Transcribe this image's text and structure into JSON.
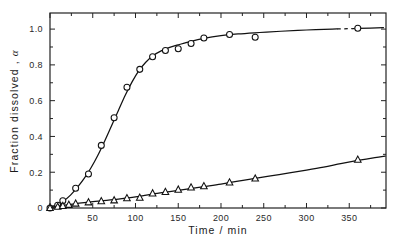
{
  "chart_data": {
    "type": "scatter",
    "title": "",
    "xlabel": "Time / min",
    "ylabel": "Fraction dissolved, α",
    "ylabel_text": "Fraction  dissolved ,",
    "ylabel_symbol": "α",
    "xlim": [
      0,
      393
    ],
    "ylim": [
      0,
      1.09
    ],
    "grid": false,
    "legend": "none",
    "x_ticks": [
      0,
      50,
      100,
      150,
      200,
      250,
      300,
      350
    ],
    "x_tick_labels": [
      "",
      "50",
      "100",
      "150",
      "200",
      "250",
      "300",
      "350"
    ],
    "x_minor_ticks": [
      25,
      75,
      125,
      175,
      225,
      275,
      325,
      375
    ],
    "y_ticks": [
      0,
      0.2,
      0.4,
      0.6,
      0.8,
      1.0
    ],
    "y_tick_labels": [
      "0",
      "0.2",
      "0.4",
      "0.6",
      "0.8",
      "1.0"
    ],
    "y_minor_ticks": [
      0.1,
      0.3,
      0.5,
      0.7,
      0.9
    ],
    "series": [
      {
        "name": "series-circles",
        "marker": "circle",
        "color": "#111111",
        "x": [
          0,
          9,
          15,
          30,
          45,
          60,
          75,
          90,
          105,
          120,
          135,
          150,
          165,
          180,
          210,
          240,
          360
        ],
        "y": [
          0.0,
          0.015,
          0.04,
          0.11,
          0.19,
          0.35,
          0.505,
          0.675,
          0.775,
          0.845,
          0.88,
          0.89,
          0.92,
          0.95,
          0.97,
          0.955,
          1.005
        ],
        "fit_x": [
          0,
          8,
          16,
          24,
          32,
          40,
          48,
          56,
          64,
          72,
          80,
          88,
          96,
          104,
          112,
          120,
          130,
          140,
          150,
          165,
          180,
          200,
          220,
          245,
          270,
          300,
          330,
          360,
          390
        ],
        "fit_y": [
          0.005,
          0.018,
          0.04,
          0.072,
          0.115,
          0.165,
          0.225,
          0.295,
          0.375,
          0.46,
          0.545,
          0.63,
          0.705,
          0.768,
          0.815,
          0.85,
          0.878,
          0.898,
          0.912,
          0.932,
          0.948,
          0.963,
          0.973,
          0.981,
          0.988,
          0.995,
          1.0,
          1.004,
          1.008
        ],
        "break_x": [
          336,
          354
        ]
      },
      {
        "name": "series-triangles",
        "marker": "triangle",
        "color": "#111111",
        "x": [
          0,
          9,
          15,
          22,
          30,
          45,
          60,
          75,
          90,
          105,
          120,
          135,
          150,
          165,
          180,
          210,
          240,
          360
        ],
        "y": [
          0.0,
          0.007,
          0.012,
          0.018,
          0.025,
          0.032,
          0.038,
          0.043,
          0.055,
          0.058,
          0.082,
          0.09,
          0.103,
          0.115,
          0.122,
          0.143,
          0.165,
          0.27
        ],
        "fit_x": [
          0,
          20,
          40,
          60,
          80,
          100,
          120,
          140,
          160,
          180,
          200,
          220,
          240,
          260,
          280,
          300,
          320,
          340,
          360,
          380,
          392
        ],
        "fit_y": [
          0.003,
          0.018,
          0.03,
          0.04,
          0.05,
          0.062,
          0.078,
          0.092,
          0.106,
          0.12,
          0.134,
          0.15,
          0.166,
          0.181,
          0.196,
          0.212,
          0.229,
          0.248,
          0.266,
          0.282,
          0.29
        ]
      }
    ]
  },
  "plot_geometry": {
    "left": 50,
    "right": 386,
    "top": 13,
    "bottom": 208
  }
}
